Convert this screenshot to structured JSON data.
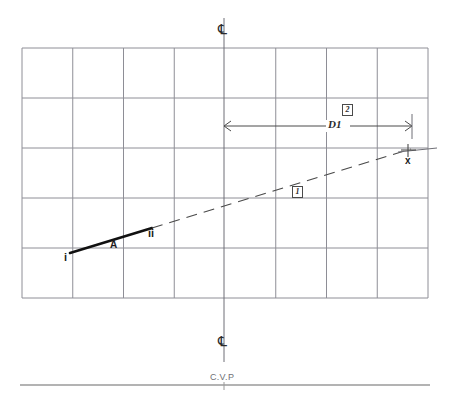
{
  "drawing": {
    "title": "Technical layout drawing with grid, centerlines and dimensioned baseline",
    "colors": {
      "paper": "#ffffff",
      "grid_line": "#8e8e96",
      "grid_border": "#8e8e96",
      "centerline": "#6f6f76",
      "dimension_line": "#4a4a4a",
      "dashed_line": "#4a4a4a",
      "bold_segment": "#111111",
      "text": "#2b2b2b",
      "baseline": "#9a9a9a"
    },
    "grid": {
      "columns": 8,
      "rows": 5,
      "left": 22,
      "top": 48,
      "right": 428,
      "bottom": 298,
      "cell_width": 50.75,
      "cell_height": 50,
      "x_positions": [
        22,
        72.75,
        123.5,
        174.25,
        225,
        275.75,
        326.5,
        377.25,
        428
      ],
      "y_positions": [
        48,
        98,
        148,
        198,
        248,
        298
      ]
    },
    "centerline": {
      "x": 224,
      "top_y": 18,
      "bottom_y": 362,
      "symbol": "℄",
      "symbol_name": "center-line-symbol",
      "top_symbol_y": 31,
      "bottom_symbol_y": 343
    },
    "baseline": {
      "label": "C.V.P",
      "label_x": 224,
      "label_y": 379,
      "line_y": 385,
      "line_x1": 20,
      "line_x2": 430,
      "tick_height": 7
    },
    "bold_segment": {
      "name": "segment-A",
      "label": "A",
      "label_x": 113,
      "label_y": 248,
      "start": {
        "label": "i",
        "x": 70,
        "y": 253,
        "label_x": 66,
        "label_y": 258
      },
      "end": {
        "label": "ii",
        "x": 152,
        "y": 228,
        "label_x": 150,
        "label_y": 232
      }
    },
    "dashed_line": {
      "name": "projection-line-1",
      "callout": "1",
      "callout_x": 291,
      "callout_y": 186,
      "from": {
        "x": 152,
        "y": 228
      },
      "to": {
        "x": 411,
        "y": 149
      }
    },
    "extension_line": {
      "x1": 405,
      "x2": 437,
      "y": 150
    },
    "target_mark": {
      "label": "x",
      "name": "target-point-x",
      "x": 408,
      "y": 150,
      "label_x": 406,
      "label_y": 158,
      "tick_size": 6
    },
    "dimension": {
      "name": "dimension-D1",
      "label": "D1",
      "callout": "2",
      "label_x": 330,
      "label_y": 121,
      "callout_x": 343,
      "callout_y": 106,
      "line_y": 126,
      "x_start": 224,
      "x_end": 412,
      "extension_top": 114,
      "extension_bottom": 137
    }
  }
}
